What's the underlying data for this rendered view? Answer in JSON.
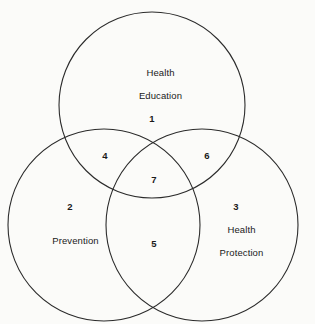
{
  "diagram": {
    "type": "venn",
    "set_count": 3,
    "background_color": "#fbfbf9",
    "stroke_color": "#2b2b2b",
    "text_color": "#1a1a1a",
    "sets": [
      {
        "id": "health-education",
        "label": "Health\nEducation",
        "label_line1": "Health",
        "label_line2": "Education",
        "cx": 152,
        "cy": 105,
        "r": 93
      },
      {
        "id": "prevention",
        "label": "Prevention",
        "label_line1": "Prevention",
        "label_line2": "",
        "cx": 104,
        "cy": 225,
        "r": 96
      },
      {
        "id": "health-protection",
        "label": "Health\nProtection",
        "label_line1": "Health",
        "label_line2": "Protection",
        "cx": 202,
        "cy": 225,
        "r": 96
      }
    ],
    "regions": [
      {
        "id": "region-1",
        "number": "1",
        "x": 152,
        "y": 119,
        "belongs_to": "health-education only"
      },
      {
        "id": "region-2",
        "number": "2",
        "x": 70,
        "y": 207,
        "belongs_to": "prevention only"
      },
      {
        "id": "region-3",
        "number": "3",
        "x": 236,
        "y": 207,
        "belongs_to": "health-protection only"
      },
      {
        "id": "region-4",
        "number": "4",
        "x": 105,
        "y": 156,
        "belongs_to": "health-education and prevention"
      },
      {
        "id": "region-5",
        "number": "5",
        "x": 154,
        "y": 244,
        "belongs_to": "prevention and health-protection"
      },
      {
        "id": "region-6",
        "number": "6",
        "x": 207,
        "y": 156,
        "belongs_to": "health-education and health-protection"
      },
      {
        "id": "region-7",
        "number": "7",
        "x": 154,
        "y": 180,
        "belongs_to": "all three sets"
      }
    ],
    "set_label_positions": [
      {
        "id": "health-education",
        "x": 155,
        "y": 84
      },
      {
        "id": "prevention",
        "x": 70,
        "y": 241
      },
      {
        "id": "health-protection",
        "x": 236,
        "y": 241
      }
    ]
  }
}
